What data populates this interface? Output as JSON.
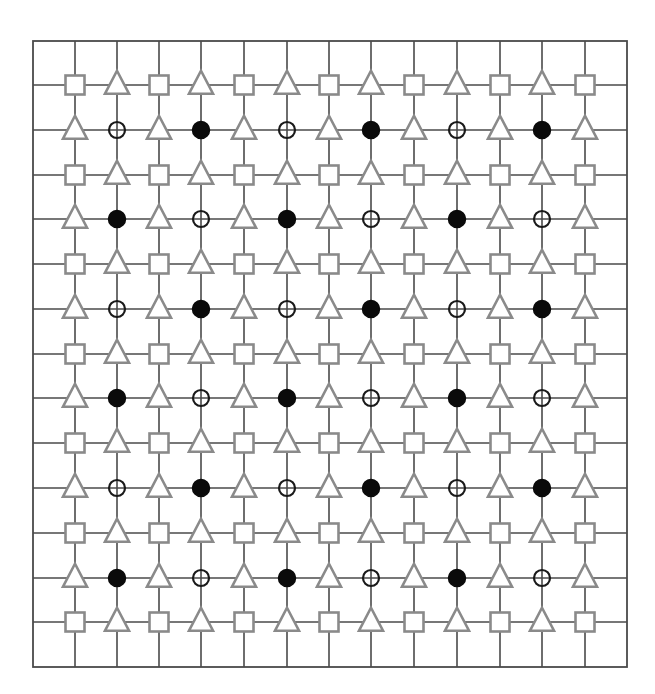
{
  "diagram": {
    "title": "",
    "frame": {
      "x0": 33,
      "y0": 41,
      "x1": 627,
      "y1": 667
    },
    "grid_x": [
      75,
      117,
      159,
      201,
      244,
      287,
      329,
      371,
      414,
      457,
      500,
      542,
      585
    ],
    "grid_y": [
      85,
      130,
      175,
      219,
      264,
      309,
      354,
      398,
      443,
      488,
      533,
      578,
      622
    ],
    "colors": {
      "grid": "#4a4a4a",
      "shape_stroke": "#8a8a8a",
      "shape_fill": "#ffffff",
      "filled_circle": "#0a0a0a"
    },
    "legend_keys": {
      "S": "square",
      "T": "triangle",
      "F": "filled-circle",
      "O": "hollow-circle"
    },
    "rows": [
      "STSTSTSTSTSTS",
      "TOTFTOTFTOTFT",
      "STSTSTSTSTSTS",
      "TFTOTFTOTFTOT",
      "STSTSTSTSTSTS",
      "TOTFTOTFTOTFT",
      "STSTSTSTSTSTS",
      "TFTOTFTOTFTOT",
      "STSTSTSTSTSTS",
      "TOTFTOTFTOTFT",
      "STSTSTSTSTSTS",
      "TFTOTFTOTFTOT",
      "STSTSTSTSTSTS"
    ]
  }
}
